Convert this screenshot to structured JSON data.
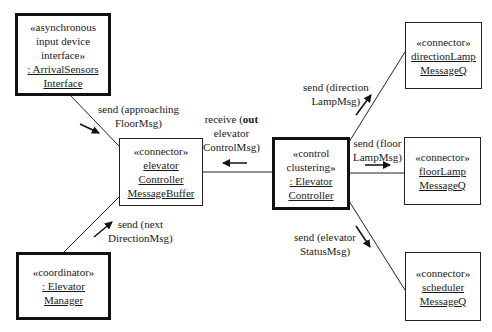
{
  "diagram": {
    "type": "UML communication diagram",
    "objects": [
      {
        "id": "arrival_sensors",
        "stereotype_lines": [
          "«asynchronous",
          "input device",
          "interface»"
        ],
        "name_lines": [
          ": ArrivalSensors",
          "Interface"
        ],
        "border": "thick"
      },
      {
        "id": "message_buffer",
        "stereotype_lines": [
          "«connector»"
        ],
        "name_lines": [
          "elevator",
          "Controller",
          "MessageBuffer"
        ],
        "border": "thin"
      },
      {
        "id": "elevator_manager",
        "stereotype_lines": [
          "«coordinator»"
        ],
        "name_lines": [
          ": Elevator",
          "Manager"
        ],
        "border": "thick"
      },
      {
        "id": "elevator_controller",
        "stereotype_lines": [
          "«control",
          "clustering»"
        ],
        "name_lines": [
          ": Elevator",
          "Controller"
        ],
        "border": "thick"
      },
      {
        "id": "direction_lamp_q",
        "stereotype_lines": [
          "«connector»"
        ],
        "name_lines": [
          "directionLamp",
          "MessageQ"
        ],
        "border": "thin"
      },
      {
        "id": "floor_lamp_q",
        "stereotype_lines": [
          "«connector»"
        ],
        "name_lines": [
          "floorLamp",
          "MessageQ"
        ],
        "border": "thin"
      },
      {
        "id": "scheduler_q",
        "stereotype_lines": [
          "«connector»"
        ],
        "name_lines": [
          "scheduler",
          "MessageQ"
        ],
        "border": "thin"
      }
    ],
    "messages": [
      {
        "from": "arrival_sensors",
        "to": "message_buffer",
        "lines": [
          "send (approaching",
          "FloorMsg)"
        ]
      },
      {
        "from": "elevator_manager",
        "to": "message_buffer",
        "lines": [
          "send (next",
          "DirectionMsg)"
        ]
      },
      {
        "from": "elevator_controller",
        "to": "message_buffer",
        "lines_prefix": "receive (",
        "lines_bold": "out",
        "lines": [
          "receive (out",
          "elevator",
          "ControlMsg)"
        ]
      },
      {
        "from": "elevator_controller",
        "to": "direction_lamp_q",
        "lines": [
          "send (direction",
          "LampMsg)"
        ]
      },
      {
        "from": "elevator_controller",
        "to": "floor_lamp_q",
        "lines": [
          "send (floor",
          "LampMsg)"
        ]
      },
      {
        "from": "elevator_controller",
        "to": "scheduler_q",
        "lines": [
          "send (elevator",
          "StatusMsg)"
        ]
      }
    ]
  },
  "labels": {
    "arrival": {
      "s1": "«asynchronous",
      "s2": "input device",
      "s3": "interface»",
      "n1": ": ArrivalSensors",
      "n2": "Interface"
    },
    "buffer": {
      "s1": "«connector»",
      "n1": "elevator",
      "n2": "Controller",
      "n3": "MessageBuffer"
    },
    "manager": {
      "s1": "«coordinator»",
      "n1": ": Elevator",
      "n2": "Manager"
    },
    "controller": {
      "s1": "«control",
      "s2": "clustering»",
      "n1": ": Elevator",
      "n2": "Controller"
    },
    "dirlamp": {
      "s1": "«connector»",
      "n1": "directionLamp",
      "n2": "MessageQ"
    },
    "floorlamp": {
      "s1": "«connector»",
      "n1": "floorLamp",
      "n2": "MessageQ"
    },
    "sched": {
      "s1": "«connector»",
      "n1": "scheduler",
      "n2": "MessageQ"
    },
    "msg_approach": {
      "l1": "send (approaching",
      "l2": "FloorMsg)"
    },
    "msg_next": {
      "l1": "send (next",
      "l2": "DirectionMsg)"
    },
    "msg_receive": {
      "pre": "receive (",
      "bold": "out",
      "l2": "elevator",
      "l3": "ControlMsg)"
    },
    "msg_dirlamp": {
      "l1": "send (direction",
      "l2": "LampMsg)"
    },
    "msg_floorlamp": {
      "l1": "send (floor",
      "l2": "LampMsg)"
    },
    "msg_status": {
      "l1": "send (elevator",
      "l2": "StatusMsg)"
    }
  }
}
